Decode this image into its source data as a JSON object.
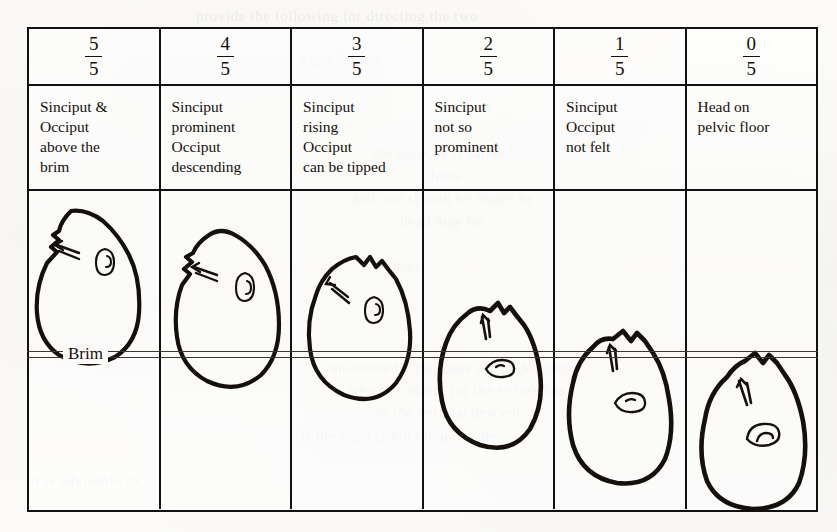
{
  "figure": {
    "brim_label": "Brim",
    "ink_color": "#15100c",
    "rule_color": "#111111",
    "paper_color": "#fbfaf8"
  },
  "columns": [
    {
      "fraction_numerator": "5",
      "fraction_denominator": "5",
      "description_lines": [
        "Sinciput &",
        "Occiput",
        "above the",
        "brim"
      ],
      "fifths_below_brim": 0
    },
    {
      "fraction_numerator": "4",
      "fraction_denominator": "5",
      "description_lines": [
        "Sinciput",
        "prominent",
        "Occiput",
        "descending"
      ],
      "fifths_below_brim": 1
    },
    {
      "fraction_numerator": "3",
      "fraction_denominator": "5",
      "description_lines": [
        "Sinciput",
        "rising",
        "Occiput",
        "can be tipped"
      ],
      "fifths_below_brim": 2
    },
    {
      "fraction_numerator": "2",
      "fraction_denominator": "5",
      "description_lines": [
        "Sinciput",
        "not so",
        "prominent"
      ],
      "fifths_below_brim": 3
    },
    {
      "fraction_numerator": "1",
      "fraction_denominator": "5",
      "description_lines": [
        "Sinciput",
        "Occiput",
        "not felt"
      ],
      "fifths_below_brim": 4
    },
    {
      "fraction_numerator": "0",
      "fraction_denominator": "5",
      "description_lines": [
        "Head on",
        "pelvic floor"
      ],
      "fifths_below_brim": 5
    }
  ],
  "bleed_through": [
    {
      "text": "provide the following for directing the two",
      "x": 196,
      "y": 8,
      "size": 15
    },
    {
      "text": "examination",
      "x": 300,
      "y": 52,
      "size": 15
    },
    {
      "text": "the purpose is rather",
      "x": 372,
      "y": 145,
      "size": 15
    },
    {
      "text": "fetus",
      "x": 430,
      "y": 168,
      "size": 15
    },
    {
      "text": "and one should be aware by",
      "x": 352,
      "y": 190,
      "size": 15
    },
    {
      "text": "head may be",
      "x": 400,
      "y": 213,
      "size": 15
    },
    {
      "text": "the",
      "x": 392,
      "y": 258,
      "size": 15
    },
    {
      "text": "undoubtedly however at not descent",
      "x": 330,
      "y": 360,
      "size": 15
    },
    {
      "text": "who the ascent for the vertex has",
      "x": 348,
      "y": 382,
      "size": 15
    },
    {
      "text": "to the vertical descent",
      "x": 376,
      "y": 404,
      "size": 15
    },
    {
      "text": "If the head is not obtained the",
      "x": 300,
      "y": 428,
      "size": 15
    },
    {
      "text": "it is advisable to",
      "x": 30,
      "y": 472,
      "size": 15
    }
  ]
}
